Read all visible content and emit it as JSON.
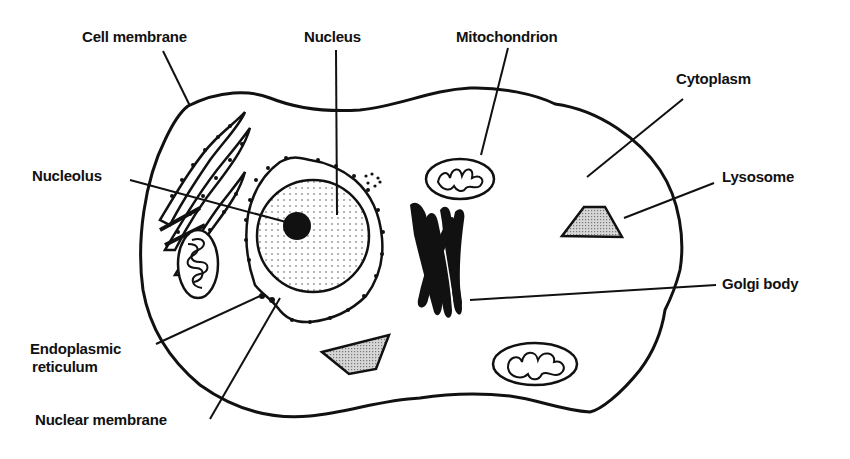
{
  "diagram": {
    "colors": {
      "ink": "#111111",
      "background": "#ffffff",
      "stipple_fill": "#e6e6e6"
    },
    "labels": {
      "cell_membrane": "Cell membrane",
      "nucleus": "Nucleus",
      "mitochondrion": "Mitochondrion",
      "cytoplasm": "Cytoplasm",
      "nucleolus": "Nucleolus",
      "lysosome": "Lysosome",
      "golgi_body": "Golgi body",
      "endoplasmic_reticulum_line1": "Endoplasmic",
      "endoplasmic_reticulum_line2": "reticulum",
      "nuclear_membrane": "Nuclear membrane"
    }
  }
}
